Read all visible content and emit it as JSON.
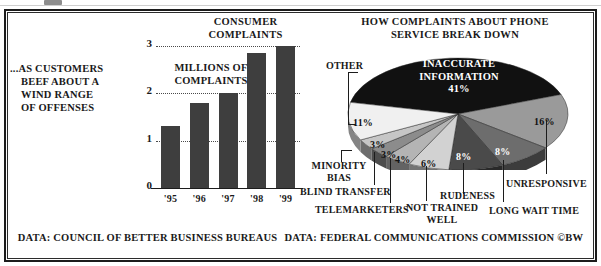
{
  "caption": {
    "lines": [
      "...AS CUSTOMERS",
      "BEEF ABOUT A",
      "WIND RANGE",
      "OF OFFENSES"
    ]
  },
  "footer": {
    "source_left": "DATA: COUNCIL OF BETTER BUSINESS BUREAUS",
    "source_right": "DATA: FEDERAL COMMUNICATIONS COMMISSION",
    "credit": "©BW"
  },
  "chart_data": [
    {
      "type": "bar",
      "title": "CONSUMER COMPLAINTS",
      "title_line1": "CONSUMER",
      "title_line2": "COMPLAINTS",
      "ylabel": "MILLIONS OF COMPLAINTS",
      "ylabel_line1": "MILLIONS OF",
      "ylabel_line2": "COMPLAINTS",
      "xlabel": "",
      "categories": [
        "'95",
        "'96",
        "'97",
        "'98",
        "'99"
      ],
      "values": [
        1.3,
        1.8,
        2.0,
        2.85,
        3.0
      ],
      "ylim": [
        0,
        3
      ],
      "yticks": [
        "0",
        "1",
        "2",
        "3"
      ],
      "ytick_values": [
        0,
        1,
        2,
        3
      ],
      "grid": true,
      "bar_color": "#3e3e3e"
    },
    {
      "type": "pie",
      "title": "HOW COMPLAINTS ABOUT PHONE SERVICE BREAK DOWN",
      "title_line1": "HOW COMPLAINTS ABOUT PHONE",
      "title_line2": "SERVICE BREAK DOWN",
      "center_label_line1": "INACCURATE",
      "center_label_line2": "INFORMATION",
      "center_label_value": "41%",
      "legend_position": "callout-labels",
      "slices": [
        {
          "label": "INACCURATE INFORMATION",
          "value": 41,
          "display": "41%",
          "color": "#111111",
          "label_placement": "inside"
        },
        {
          "label": "UNRESPONSIVE",
          "value": 16,
          "display": "16%",
          "color": "#9a9a9a",
          "label_placement": "callout-right"
        },
        {
          "label": "LONG WAIT TIME",
          "value": 8,
          "display": "8%",
          "color": "#6d6d6d",
          "label_placement": "callout-bottom"
        },
        {
          "label": "RUDENESS",
          "value": 8,
          "display": "8%",
          "color": "#4a4a4a",
          "label_placement": "callout-bottom"
        },
        {
          "label": "NOT TRAINED WELL",
          "value": 6,
          "display": "6%",
          "color": "#d2d2d2",
          "label_placement": "callout-bottom"
        },
        {
          "label": "TELEMARKETERS",
          "value": 4,
          "display": "4%",
          "color": "#b4b4b4",
          "label_placement": "callout-bottom"
        },
        {
          "label": "BLIND TRANSFER",
          "value": 3,
          "display": "3%",
          "color": "#8c8c8c",
          "label_placement": "callout-bottom"
        },
        {
          "label": "MINORITY BIAS",
          "value": 3,
          "display": "3%",
          "color": "#c6c6c6",
          "label_placement": "callout-left"
        },
        {
          "label": "OTHER",
          "value": 11,
          "display": "11%",
          "color": "#f0f0f0",
          "label_placement": "callout-left"
        }
      ],
      "labels_outside": {
        "other": "OTHER",
        "minority_bias_line1": "MINORITY",
        "minority_bias_line2": "BIAS",
        "blind_transfer": "BLIND TRANSFER",
        "telemarketers": "TELEMARKETERS",
        "not_trained_line1": "NOT TRAINED",
        "not_trained_line2": "WELL",
        "rudeness": "RUDENESS",
        "long_wait_time": "LONG WAIT TIME",
        "unresponsive": "UNRESPONSIVE"
      },
      "value_labels": {
        "other": "11%",
        "minority_bias": "3%",
        "blind_transfer": "3%",
        "telemarketers": "4%",
        "not_trained": "6%",
        "rudeness": "8%",
        "long_wait": "8%",
        "unresponsive": "16%"
      }
    }
  ]
}
